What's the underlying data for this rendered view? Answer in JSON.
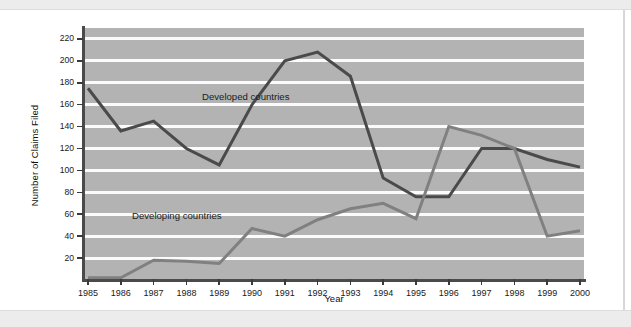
{
  "chart_data": {
    "type": "line",
    "title": "",
    "xlabel": "Year",
    "ylabel": "Number of Claims Filed",
    "categories": [
      "1985",
      "1986",
      "1987",
      "1988",
      "1989",
      "1990",
      "1991",
      "1992",
      "1993",
      "1994",
      "1995",
      "1996",
      "1997",
      "1998",
      "1999",
      "2000"
    ],
    "x": [
      1985,
      1986,
      1987,
      1988,
      1989,
      1990,
      1991,
      1992,
      1993,
      1994,
      1995,
      1996,
      1997,
      1998,
      1999,
      2000
    ],
    "ylim": [
      0,
      230
    ],
    "yticks": [
      20,
      40,
      60,
      80,
      100,
      120,
      140,
      160,
      180,
      200,
      220
    ],
    "grid": true,
    "legend_position": "inline-annotation",
    "series": [
      {
        "name": "Developed countries",
        "color": "#4a4a4a",
        "values": [
          175,
          136,
          145,
          120,
          105,
          160,
          200,
          208,
          186,
          93,
          76,
          76,
          120,
          120,
          110,
          103
        ],
        "annotation": "Developed countries"
      },
      {
        "name": "Developing countries",
        "color": "#808080",
        "values": [
          2,
          2,
          18,
          17,
          15,
          47,
          40,
          55,
          65,
          70,
          56,
          140,
          132,
          120,
          40,
          45
        ],
        "annotation": "Developing countries"
      }
    ]
  },
  "annotations": {
    "developed_label": "Developed countries",
    "developing_label": "Developing countries"
  },
  "axes": {
    "ylabel": "Number of Claims Filed",
    "xlabel": "Year"
  }
}
